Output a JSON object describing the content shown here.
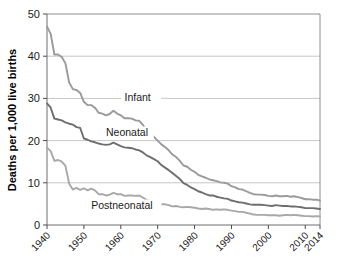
{
  "chart_data": {
    "type": "line",
    "title": "",
    "subtitle": "",
    "xlabel": "",
    "ylabel": "Deaths per 1,000 live births",
    "xlim": [
      1940,
      2014
    ],
    "ylim": [
      0,
      50
    ],
    "grid": true,
    "legend_position": "inline-annotations",
    "x_ticks": [
      "1940",
      "1950",
      "1960",
      "1970",
      "1980",
      "1990",
      "2000",
      "2010",
      "2014"
    ],
    "x_tick_values": [
      1940,
      1950,
      1960,
      1970,
      1980,
      1990,
      2000,
      2010,
      2014
    ],
    "y_ticks": [
      "0",
      "10",
      "20",
      "30",
      "40",
      "50"
    ],
    "y_tick_values": [
      0,
      10,
      20,
      30,
      40,
      50
    ],
    "colors": {
      "infant": "#9a9a9a",
      "neonatal": "#6e6e6e",
      "postneonatal": "#a8a8a8",
      "gridline": "#b9b9b9",
      "axis": "#6e6e6e",
      "text": "#1a1a1a",
      "background": "#ffffff"
    },
    "x": [
      1940,
      1941,
      1942,
      1943,
      1944,
      1945,
      1946,
      1947,
      1948,
      1949,
      1950,
      1951,
      1952,
      1953,
      1954,
      1955,
      1956,
      1957,
      1958,
      1959,
      1960,
      1961,
      1962,
      1963,
      1964,
      1965,
      1966,
      1967,
      1968,
      1969,
      1970,
      1971,
      1972,
      1973,
      1974,
      1975,
      1976,
      1977,
      1978,
      1979,
      1980,
      1981,
      1982,
      1983,
      1984,
      1985,
      1986,
      1987,
      1988,
      1989,
      1990,
      1991,
      1992,
      1993,
      1994,
      1995,
      1996,
      1997,
      1998,
      1999,
      2000,
      2001,
      2002,
      2003,
      2004,
      2005,
      2006,
      2007,
      2008,
      2009,
      2010,
      2011,
      2012,
      2013,
      2014
    ],
    "series": [
      {
        "name": "Infant",
        "label": "Infant",
        "color": "#9a9a9a",
        "values": [
          47.0,
          45.3,
          40.4,
          40.4,
          39.8,
          38.3,
          33.8,
          32.2,
          32.0,
          31.3,
          29.2,
          28.4,
          28.4,
          27.8,
          26.6,
          26.4,
          26.0,
          26.3,
          27.1,
          26.4,
          26.0,
          25.3,
          25.3,
          25.2,
          24.8,
          24.7,
          23.7,
          22.4,
          21.8,
          20.9,
          20.0,
          19.1,
          18.5,
          17.7,
          16.7,
          16.1,
          15.2,
          14.1,
          13.8,
          13.1,
          12.6,
          11.9,
          11.5,
          11.2,
          10.8,
          10.6,
          10.4,
          10.1,
          10.0,
          9.8,
          9.2,
          8.9,
          8.5,
          8.4,
          8.0,
          7.6,
          7.3,
          7.2,
          7.2,
          7.1,
          6.9,
          6.8,
          7.0,
          6.8,
          6.8,
          6.9,
          6.7,
          6.8,
          6.6,
          6.4,
          6.1,
          6.1,
          6.0,
          6.0,
          5.8
        ]
      },
      {
        "name": "Neonatal",
        "label": "Neonatal",
        "color": "#6e6e6e",
        "values": [
          28.8,
          27.8,
          25.2,
          25.0,
          24.8,
          24.3,
          24.0,
          23.8,
          23.2,
          23.0,
          20.5,
          20.2,
          19.8,
          19.6,
          19.3,
          19.1,
          19.0,
          19.1,
          19.5,
          19.1,
          18.7,
          18.4,
          18.3,
          18.2,
          17.9,
          17.7,
          17.2,
          16.5,
          16.1,
          15.6,
          15.1,
          14.2,
          13.6,
          13.0,
          12.3,
          11.6,
          10.9,
          9.9,
          9.5,
          8.9,
          8.5,
          8.0,
          7.7,
          7.3,
          7.0,
          7.0,
          6.7,
          6.5,
          6.3,
          6.2,
          5.8,
          5.6,
          5.4,
          5.3,
          5.1,
          4.9,
          4.8,
          4.8,
          4.8,
          4.7,
          4.6,
          4.5,
          4.7,
          4.6,
          4.5,
          4.5,
          4.4,
          4.4,
          4.3,
          4.2,
          4.0,
          4.0,
          4.0,
          3.9,
          3.8
        ]
      },
      {
        "name": "Postneonatal",
        "label": "Postneonatal",
        "color": "#a8a8a8",
        "values": [
          18.3,
          17.5,
          15.2,
          15.4,
          15.0,
          14.0,
          9.8,
          8.4,
          8.8,
          8.3,
          8.7,
          8.2,
          8.6,
          8.2,
          7.3,
          7.3,
          7.0,
          7.2,
          7.6,
          7.3,
          7.3,
          6.9,
          7.0,
          7.0,
          6.9,
          7.0,
          6.5,
          5.9,
          5.7,
          5.3,
          4.9,
          4.9,
          4.9,
          4.7,
          4.4,
          4.5,
          4.3,
          4.2,
          4.3,
          4.2,
          4.1,
          3.9,
          3.8,
          3.9,
          3.8,
          3.6,
          3.7,
          3.6,
          3.7,
          3.6,
          3.4,
          3.3,
          3.1,
          3.1,
          2.9,
          2.7,
          2.5,
          2.4,
          2.4,
          2.4,
          2.3,
          2.3,
          2.3,
          2.2,
          2.3,
          2.4,
          2.3,
          2.4,
          2.3,
          2.2,
          2.1,
          2.1,
          2.0,
          2.1,
          2.0
        ]
      }
    ],
    "annotations": [
      {
        "text": "Infant",
        "x": 1961,
        "y": 29.5
      },
      {
        "text": "Neonatal",
        "x": 1956,
        "y": 21.2
      },
      {
        "text": "Postneonatal",
        "x": 1952,
        "y": 3.9
      }
    ]
  }
}
